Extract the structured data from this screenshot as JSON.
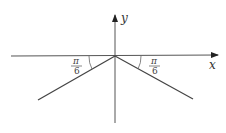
{
  "diagram": {
    "x_axis_label": "x",
    "y_axis_label": "y",
    "left_angle": {
      "numerator": "π",
      "denominator": "6"
    },
    "right_angle": {
      "numerator": "π",
      "denominator": "6"
    },
    "colors": {
      "line": "#444444",
      "background": "#ffffff"
    }
  }
}
